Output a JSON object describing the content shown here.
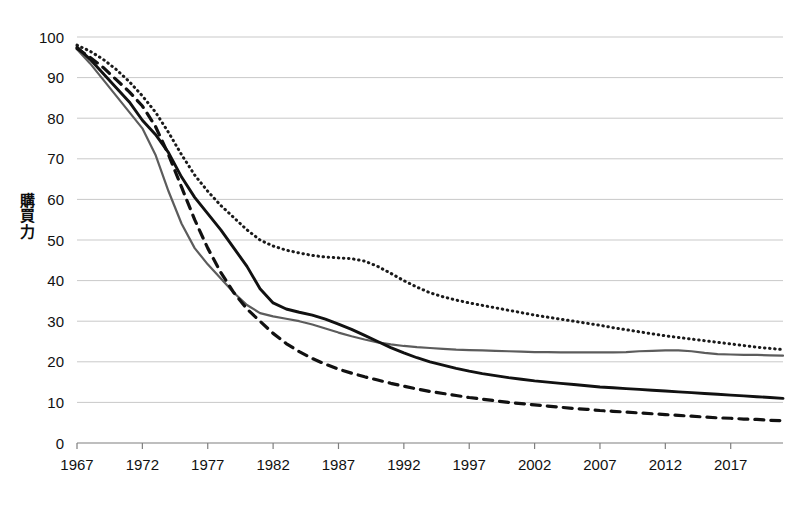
{
  "chart_data": {
    "type": "line",
    "title": "",
    "subtitle": "",
    "xlabel": "",
    "ylabel": "購買力",
    "ylabel_chars": [
      "購",
      "買",
      "力"
    ],
    "xlim": [
      1967,
      2021
    ],
    "ylim": [
      0,
      100
    ],
    "y_ticks": [
      0,
      10,
      20,
      30,
      40,
      50,
      60,
      70,
      80,
      90,
      100
    ],
    "x_ticks": [
      1967,
      1972,
      1977,
      1982,
      1987,
      1992,
      1997,
      2002,
      2007,
      2012,
      2017
    ],
    "x_tick_labels": [
      "1967",
      "1972",
      "1977",
      "1982",
      "1987",
      "1992",
      "1997",
      "2002",
      "2007",
      "2012",
      "2017"
    ],
    "y_tick_labels": [
      "0",
      "10",
      "20",
      "30",
      "40",
      "50",
      "60",
      "70",
      "80",
      "90",
      "100"
    ],
    "grid": true,
    "grid_color": "#c9c9c9",
    "legend": "none",
    "axis_color": "#7f7f7f",
    "x": [
      1967,
      1968,
      1969,
      1970,
      1971,
      1972,
      1973,
      1974,
      1975,
      1976,
      1977,
      1978,
      1979,
      1980,
      1981,
      1982,
      1983,
      1984,
      1985,
      1986,
      1987,
      1988,
      1989,
      1990,
      1991,
      1992,
      1993,
      1994,
      1995,
      1996,
      1997,
      1998,
      1999,
      2000,
      2001,
      2002,
      2003,
      2004,
      2005,
      2006,
      2007,
      2008,
      2009,
      2010,
      2011,
      2012,
      2013,
      2014,
      2015,
      2016,
      2017,
      2018,
      2019,
      2020,
      2021
    ],
    "series": [
      {
        "name": "series-dotted",
        "style": "dotted",
        "color": "#1a1a1a",
        "width": 3.0,
        "dasharray": "0.5,4.6",
        "values": [
          98.0,
          96.5,
          94.5,
          92.0,
          89.0,
          85.5,
          81.5,
          76.5,
          71.0,
          66.0,
          62.0,
          58.5,
          55.5,
          52.5,
          50.0,
          48.5,
          47.5,
          46.8,
          46.2,
          45.8,
          45.6,
          45.4,
          44.8,
          43.5,
          41.8,
          40.0,
          38.4,
          37.0,
          36.0,
          35.2,
          34.5,
          33.9,
          33.3,
          32.7,
          32.1,
          31.5,
          31.0,
          30.5,
          30.0,
          29.5,
          29.0,
          28.4,
          27.9,
          27.4,
          26.9,
          26.4,
          26.0,
          25.6,
          25.2,
          24.8,
          24.4,
          24.0,
          23.6,
          23.3,
          23.0
        ]
      },
      {
        "name": "series-gray-solid",
        "style": "solid",
        "color": "#5c5c5c",
        "width": 2.2,
        "dasharray": "none",
        "values": [
          97.0,
          93.5,
          89.5,
          85.5,
          81.5,
          77.5,
          71.0,
          62.0,
          54.0,
          48.0,
          44.0,
          40.5,
          37.0,
          34.0,
          32.0,
          31.2,
          30.6,
          30.0,
          29.2,
          28.2,
          27.2,
          26.3,
          25.5,
          24.8,
          24.3,
          23.9,
          23.6,
          23.4,
          23.2,
          23.0,
          22.9,
          22.8,
          22.7,
          22.6,
          22.5,
          22.4,
          22.4,
          22.3,
          22.3,
          22.3,
          22.3,
          22.3,
          22.4,
          22.6,
          22.7,
          22.8,
          22.8,
          22.6,
          22.2,
          21.9,
          21.8,
          21.7,
          21.7,
          21.6,
          21.5
        ]
      },
      {
        "name": "series-black-solid",
        "style": "solid",
        "color": "#111111",
        "width": 2.9,
        "dasharray": "none",
        "values": [
          97.5,
          94.5,
          91.0,
          87.5,
          84.0,
          79.5,
          76.0,
          71.5,
          65.5,
          60.5,
          56.5,
          52.5,
          48.0,
          43.5,
          38.0,
          34.5,
          33.0,
          32.2,
          31.5,
          30.5,
          29.3,
          28.0,
          26.5,
          25.0,
          23.5,
          22.2,
          21.0,
          20.0,
          19.2,
          18.4,
          17.7,
          17.1,
          16.6,
          16.1,
          15.7,
          15.3,
          15.0,
          14.7,
          14.4,
          14.1,
          13.8,
          13.6,
          13.4,
          13.2,
          13.0,
          12.8,
          12.6,
          12.4,
          12.2,
          12.0,
          11.8,
          11.6,
          11.4,
          11.2,
          11.0
        ]
      },
      {
        "name": "series-dashed",
        "style": "dashed",
        "color": "#111111",
        "width": 3.2,
        "dasharray": "9,7",
        "values": [
          97.2,
          95.0,
          92.5,
          89.5,
          86.5,
          83.0,
          78.0,
          71.0,
          63.0,
          55.0,
          48.0,
          42.0,
          37.0,
          33.0,
          30.0,
          27.0,
          24.5,
          22.5,
          20.8,
          19.4,
          18.2,
          17.2,
          16.3,
          15.5,
          14.7,
          14.0,
          13.3,
          12.7,
          12.2,
          11.7,
          11.2,
          10.8,
          10.4,
          10.0,
          9.7,
          9.4,
          9.1,
          8.8,
          8.5,
          8.3,
          8.0,
          7.8,
          7.6,
          7.4,
          7.2,
          7.0,
          6.8,
          6.6,
          6.4,
          6.2,
          6.1,
          5.9,
          5.8,
          5.6,
          5.5
        ]
      }
    ]
  }
}
